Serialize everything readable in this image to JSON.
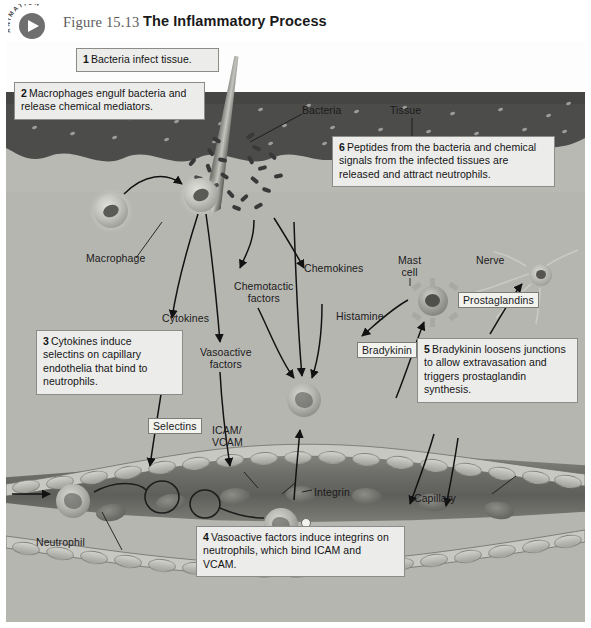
{
  "header": {
    "badge_text": "ANIMATION",
    "badge_icon": "play-icon",
    "figure_number": "Figure 15.13",
    "figure_title": "The Inflammatory Process"
  },
  "callouts": [
    {
      "id": "1",
      "number": "1",
      "text": "Bacteria infect tissue."
    },
    {
      "id": "2",
      "number": "2",
      "text": "Macrophages engulf bacteria and release chemical mediators."
    },
    {
      "id": "3",
      "number": "3",
      "text": "Cytokines induce selectins on capillary endothelia that bind to neutrophils."
    },
    {
      "id": "4",
      "number": "4",
      "text": "Vasoactive factors induce integrins on neutrophils, which bind ICAM and VCAM."
    },
    {
      "id": "5",
      "number": "5",
      "text": "Bradykinin loosens junctions to allow extravasation and triggers prostaglandin synthesis."
    },
    {
      "id": "6",
      "number": "6",
      "text": "Peptides from the bacteria and chemical signals from the infected tissues are released and attract neutrophils."
    }
  ],
  "labels": {
    "bacteria": "Bacteria",
    "tissue": "Tissue",
    "macrophage": "Macrophage",
    "cytokines": "Cytokines",
    "vasoactive_factors_line1": "Vasoactive",
    "vasoactive_factors_line2": "factors",
    "chemotactic_line1": "Chemotactic",
    "chemotactic_line2": "factors",
    "chemokines": "Chemokines",
    "histamine": "Histamine",
    "mast_cell_line1": "Mast",
    "mast_cell_line2": "cell",
    "nerve": "Nerve",
    "prostaglandins": "Prostaglandins",
    "bradykinin": "Bradykinin",
    "selectins": "Selectins",
    "icam_vcam_line1": "ICAM/",
    "icam_vcam_line2": "VCAM",
    "integrin": "Integrin",
    "neutrophil": "Neutrophil",
    "capillary": "Capillary"
  },
  "colors": {
    "background": "#ffffff",
    "tissue_deep": "#b6b6b1",
    "dermis_dark": "#4e4e4c",
    "epidermis": "#c9c9c4",
    "capillary_lumen": "#6d6d69",
    "callout_bg": "#ececeb",
    "callout_border": "#8b8b87",
    "text": "#141414",
    "title": "#1a1a1a",
    "figure_number": "#5c5c5c",
    "badge": "#6f6f6f"
  }
}
